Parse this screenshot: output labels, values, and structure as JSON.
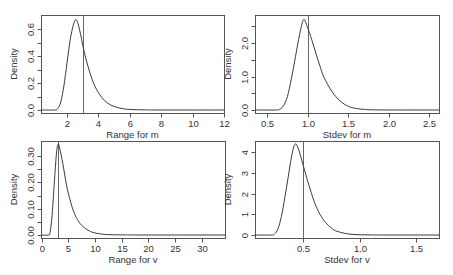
{
  "chart_data": [
    {
      "type": "line",
      "title": "",
      "xlabel": "Range for m",
      "ylabel": "Density",
      "xlim": [
        0.34,
        12.0
      ],
      "ylim": [
        0,
        0.7
      ],
      "grid": false,
      "legend": null,
      "xticks": [
        2,
        4,
        6,
        8,
        10,
        12
      ],
      "xtick_labels": [
        "2",
        "4",
        "6",
        "8",
        "10",
        "12"
      ],
      "yticks": [
        0.0,
        0.1,
        0.2,
        0.3,
        0.4,
        0.5,
        0.6
      ],
      "ytick_labels": [
        "0.0",
        "",
        "0.2",
        "",
        "0.4",
        "",
        "0.6"
      ],
      "vline": 3.0,
      "series": [
        {
          "name": "density",
          "x": [
            0.34,
            1.2,
            1.4,
            1.6,
            1.8,
            2.0,
            2.2,
            2.4,
            2.55,
            2.7,
            2.9,
            3.0,
            3.2,
            3.5,
            3.8,
            4.2,
            4.6,
            5.0,
            5.5,
            6.0,
            7.0,
            8.0,
            12.0
          ],
          "y": [
            0,
            0,
            0.01,
            0.06,
            0.18,
            0.35,
            0.52,
            0.63,
            0.67,
            0.64,
            0.54,
            0.48,
            0.38,
            0.26,
            0.17,
            0.095,
            0.05,
            0.026,
            0.011,
            0.004,
            0.001,
            0,
            0
          ]
        }
      ]
    },
    {
      "type": "line",
      "title": "",
      "xlabel": "Stdev for m",
      "ylabel": "Density",
      "xlim": [
        0.35,
        2.62
      ],
      "ylim": [
        0,
        2.8
      ],
      "grid": false,
      "legend": null,
      "xticks": [
        0.5,
        1.0,
        1.5,
        2.0,
        2.5
      ],
      "xtick_labels": [
        "0.5",
        "1.0",
        "1.5",
        "2.0",
        "2.5"
      ],
      "yticks": [
        0.0,
        0.5,
        1.0,
        1.5,
        2.0,
        2.5
      ],
      "ytick_labels": [
        "0.0",
        "",
        "1.0",
        "",
        "2.0",
        ""
      ],
      "vline": 1.0,
      "series": [
        {
          "name": "density",
          "x": [
            0.35,
            0.6,
            0.65,
            0.7,
            0.75,
            0.8,
            0.85,
            0.9,
            0.95,
            1.0,
            1.05,
            1.1,
            1.15,
            1.2,
            1.3,
            1.4,
            1.5,
            1.6,
            1.7,
            1.8,
            2.0,
            2.62
          ],
          "y": [
            0,
            0,
            0.02,
            0.12,
            0.4,
            0.95,
            1.6,
            2.25,
            2.7,
            2.45,
            2.1,
            1.7,
            1.32,
            0.98,
            0.55,
            0.27,
            0.11,
            0.045,
            0.017,
            0.006,
            0.001,
            0
          ]
        }
      ]
    },
    {
      "type": "line",
      "title": "",
      "xlabel": "Range for v",
      "ylabel": "Density",
      "xlim": [
        -0.1,
        34.4
      ],
      "ylim": [
        0,
        0.36
      ],
      "grid": false,
      "legend": null,
      "xticks": [
        0,
        5,
        10,
        15,
        20,
        25,
        30
      ],
      "xtick_labels": [
        "0",
        "5",
        "10",
        "15",
        "20",
        "25",
        "30"
      ],
      "yticks": [
        0.0,
        0.05,
        0.1,
        0.15,
        0.2,
        0.25,
        0.3
      ],
      "ytick_labels": [
        "0.00",
        "",
        "0.10",
        "",
        "0.20",
        "",
        "0.30"
      ],
      "vline": 3.0,
      "series": [
        {
          "name": "density",
          "x": [
            -0.1,
            1.3,
            1.6,
            2.0,
            2.4,
            2.8,
            3.1,
            3.4,
            4.0,
            4.5,
            5.0,
            6.0,
            7.0,
            8.0,
            9.0,
            10.0,
            12.0,
            15.0,
            20.0,
            34.4
          ],
          "y": [
            0,
            0,
            0.01,
            0.08,
            0.2,
            0.31,
            0.345,
            0.33,
            0.27,
            0.21,
            0.16,
            0.09,
            0.05,
            0.028,
            0.015,
            0.008,
            0.002,
            0.0005,
            0,
            0
          ]
        }
      ]
    },
    {
      "type": "line",
      "title": "",
      "xlabel": "Stdev for v",
      "ylabel": "Density",
      "xlim": [
        0.077,
        1.7
      ],
      "ylim": [
        0,
        4.5
      ],
      "grid": false,
      "legend": null,
      "xticks": [
        0.5,
        1.0,
        1.5
      ],
      "xtick_labels": [
        "0.5",
        "1.0",
        "1.5"
      ],
      "yticks": [
        0,
        1,
        2,
        3,
        4
      ],
      "ytick_labels": [
        "0",
        "1",
        "2",
        "3",
        "4"
      ],
      "vline": 0.5,
      "series": [
        {
          "name": "density",
          "x": [
            0.077,
            0.22,
            0.25,
            0.28,
            0.31,
            0.34,
            0.37,
            0.4,
            0.43,
            0.46,
            0.5,
            0.55,
            0.6,
            0.65,
            0.7,
            0.75,
            0.8,
            0.9,
            1.0,
            1.1,
            1.2,
            1.7
          ],
          "y": [
            0,
            0,
            0.05,
            0.3,
            0.9,
            1.8,
            2.8,
            3.8,
            4.38,
            4.15,
            3.4,
            2.45,
            1.6,
            1.0,
            0.6,
            0.34,
            0.18,
            0.05,
            0.012,
            0.003,
            0,
            0
          ]
        }
      ]
    }
  ],
  "layout": {
    "panels": [
      {
        "box": [
          41,
          15,
          224,
          113
        ],
        "y0px": 110,
        "ytop_val_px": [
          0.6,
          29
        ]
      },
      {
        "box": [
          255,
          15,
          439,
          113
        ],
        "y0px": 110,
        "ytop_val_px": [
          2.0,
          43
        ]
      },
      {
        "box": [
          41,
          141,
          225,
          238
        ],
        "y0px": 235,
        "ytop_val_px": [
          0.3,
          156
        ]
      },
      {
        "box": [
          255,
          141,
          439,
          238
        ],
        "y0px": 235,
        "ytop_val_px": [
          4,
          152
        ]
      }
    ]
  }
}
